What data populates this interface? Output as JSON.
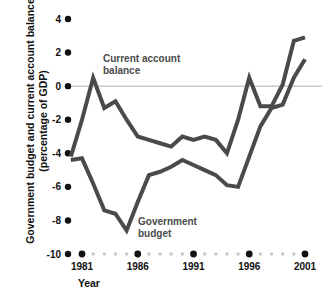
{
  "figure": {
    "width": 330,
    "height": 300,
    "background": "#ffffff"
  },
  "axis_titles": {
    "y_line1": "Government budget and current account balance",
    "y_line2": "(percentage of GDP)",
    "x": "Year"
  },
  "labels": {
    "current_account_line1": "Current account",
    "current_account_line2": "balance",
    "government_line1": "Government",
    "government_line2": "budget"
  },
  "colors": {
    "line": "#4a4a4a",
    "zero_line": "#b0b0b0",
    "tick_dot": "#111111",
    "minor_dot": "#c9c9c9",
    "text": "#111111",
    "label_text": "#4a4a4a"
  },
  "chart_data": {
    "type": "line",
    "title": "",
    "xlabel": "Year",
    "ylabel": "Government budget and current account balance (percentage of GDP)",
    "xlim": [
      1980,
      2001
    ],
    "ylim": [
      -10,
      4
    ],
    "yticks": [
      4,
      2,
      0,
      -2,
      -4,
      -6,
      -8,
      -10
    ],
    "ytick_labels": [
      "4",
      "2",
      "0",
      "-2",
      "-4",
      "-6",
      "-8",
      "-10"
    ],
    "xticks": [
      1981,
      1986,
      1991,
      1996,
      2001
    ],
    "xtick_labels": [
      "1981",
      "1986",
      "1991",
      "1996",
      "2001"
    ],
    "x_minor_ticks": [
      1982,
      1983,
      1984,
      1985,
      1987,
      1988,
      1989,
      1990,
      1992,
      1993,
      1994,
      1995,
      1997,
      1998,
      1999,
      2000
    ],
    "grid": false,
    "zero_line": true,
    "legend": "inline-annotations",
    "x": [
      1980,
      1981,
      1982,
      1983,
      1984,
      1985,
      1986,
      1987,
      1988,
      1989,
      1990,
      1991,
      1992,
      1993,
      1994,
      1995,
      1996,
      1997,
      1998,
      1999,
      2000,
      2001
    ],
    "series": [
      {
        "name": "Current account balance",
        "color": "#4a4a4a",
        "values": [
          -4.2,
          -2.0,
          0.5,
          -1.3,
          -0.9,
          -2.0,
          -3.0,
          -3.2,
          -3.4,
          -3.6,
          -3.0,
          -3.2,
          -3.0,
          -3.2,
          -4.0,
          -2.0,
          0.5,
          -1.2,
          -1.2,
          0.1,
          2.7,
          2.9
        ]
      },
      {
        "name": "Government budget",
        "color": "#4a4a4a",
        "values": [
          -4.4,
          -4.3,
          -5.8,
          -7.4,
          -7.6,
          -8.6,
          -6.9,
          -5.3,
          -5.1,
          -4.8,
          -4.4,
          -4.7,
          -5.0,
          -5.3,
          -5.9,
          -6.0,
          -4.2,
          -2.4,
          -1.3,
          -1.1,
          0.5,
          1.6
        ]
      }
    ]
  }
}
